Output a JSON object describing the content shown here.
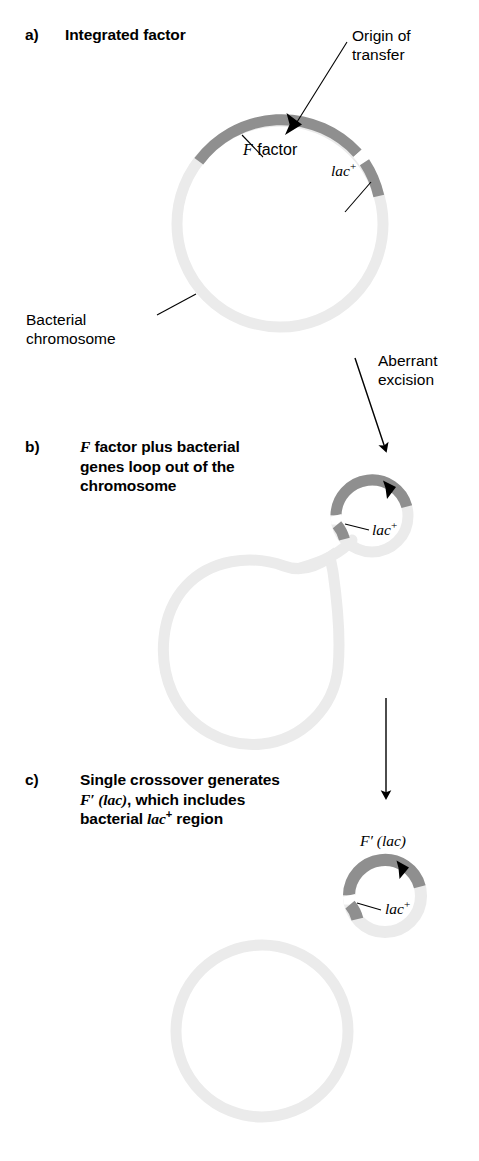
{
  "figure": {
    "background_color": "#ffffff",
    "colors": {
      "chromosome_light": "#ebebeb",
      "f_factor_dark": "#8f8f8f",
      "ink": "#000000",
      "gap_white": "#ffffff"
    }
  },
  "panels": [
    {
      "letter": "a)",
      "heading": "Integrated factor",
      "heading_parts": [
        {
          "text": "Integrated factor",
          "style": "bold"
        }
      ]
    },
    {
      "letter": "b)",
      "heading": "F factor plus bacterial genes loop out of the chromosome",
      "heading_lines": [
        [
          {
            "text": "F",
            "style": "bold-italic-serif"
          },
          {
            "text": " factor plus bacterial",
            "style": "bold"
          }
        ],
        [
          {
            "text": "genes loop out of the",
            "style": "bold"
          }
        ],
        [
          {
            "text": "chromosome",
            "style": "bold"
          }
        ]
      ]
    },
    {
      "letter": "c)",
      "heading": "Single crossover generates F' (lac), which includes bacterial lac+ region",
      "heading_lines": [
        [
          {
            "text": "Single crossover generates",
            "style": "bold"
          }
        ],
        [
          {
            "text": "F' (lac)",
            "style": "bold-italic-serif"
          },
          {
            "text": ", which includes",
            "style": "bold"
          }
        ],
        [
          {
            "text": "bacterial ",
            "style": "bold"
          },
          {
            "text": "lac",
            "style": "bold-italic-serif"
          },
          {
            "text": "+",
            "style": "bold-superscript"
          },
          {
            "text": " region",
            "style": "bold"
          }
        ]
      ]
    }
  ],
  "callouts": {
    "origin_of_transfer": {
      "line1": "Origin of",
      "line2": "transfer"
    },
    "f_factor": {
      "prefix": "F",
      "suffix": " factor"
    },
    "lac_plus": {
      "base": "lac",
      "sup": "+"
    },
    "bacterial_chromosome": {
      "line1": "Bacterial",
      "line2": "chromosome"
    },
    "aberrant_excision": {
      "line1": "Aberrant",
      "line2": "excision"
    },
    "f_prime_lac": {
      "text": "F′ (lac)"
    }
  },
  "diagram": {
    "panel_a": {
      "ring": {
        "cx": 280,
        "cy": 224,
        "r": 103,
        "stroke_width": 11
      },
      "arcs": [
        {
          "name": "bacterial-chromosome",
          "color": "#ebebeb",
          "start_deg": -8,
          "end_deg": 218
        },
        {
          "name": "f-factor",
          "color": "#8f8f8f",
          "start_deg": 218,
          "end_deg": 318
        },
        {
          "name": "gap",
          "color": "#ffffff",
          "start_deg": 318,
          "end_deg": 323
        },
        {
          "name": "lac-plus",
          "color": "#8f8f8f",
          "start_deg": 323,
          "end_deg": 352
        }
      ],
      "arrowhead_deg": 272,
      "arrow_label": "origin-of-transfer"
    },
    "panel_b": {
      "small_ring": {
        "cx": 372,
        "cy": 516,
        "r": 36,
        "stroke_width": 11
      },
      "small_arcs": [
        {
          "name": "f-factor",
          "color": "#8f8f8f",
          "start_deg": 182,
          "end_deg": 345
        },
        {
          "name": "gap",
          "color": "#ffffff",
          "start_deg": 166,
          "end_deg": 182
        },
        {
          "name": "lac-plus",
          "color": "#8f8f8f",
          "start_deg": 140,
          "end_deg": 166
        },
        {
          "name": "chromosome",
          "color": "#ebebeb",
          "start_deg": 345,
          "end_deg": 140
        }
      ],
      "arrowhead_deg": 300,
      "big_loop": {
        "cx": 252,
        "cy": 646,
        "r": 86,
        "stroke_width": 11,
        "color": "#ebebeb"
      }
    },
    "panel_c": {
      "small_ring": {
        "cx": 385,
        "cy": 896,
        "r": 36,
        "stroke_width": 12
      },
      "small_arcs": [
        {
          "name": "f-factor",
          "color": "#8f8f8f",
          "start_deg": 182,
          "end_deg": 345
        },
        {
          "name": "gap",
          "color": "#ffffff",
          "start_deg": 166,
          "end_deg": 182
        },
        {
          "name": "lac-plus",
          "color": "#8f8f8f",
          "start_deg": 140,
          "end_deg": 166
        },
        {
          "name": "chromosome",
          "color": "#ebebeb",
          "start_deg": 345,
          "end_deg": 140
        }
      ],
      "arrowhead_deg": 298,
      "big_ring": {
        "cx": 262,
        "cy": 1031,
        "r": 86,
        "stroke_width": 11,
        "color": "#ebebeb"
      }
    },
    "transition_arrows": [
      {
        "name": "aberrant-excision-arrow",
        "x1": 356,
        "y1": 362,
        "x2": 386,
        "y2": 452
      },
      {
        "name": "crossover-arrow",
        "x1": 386,
        "y1": 700,
        "x2": 386,
        "y2": 800
      }
    ]
  }
}
